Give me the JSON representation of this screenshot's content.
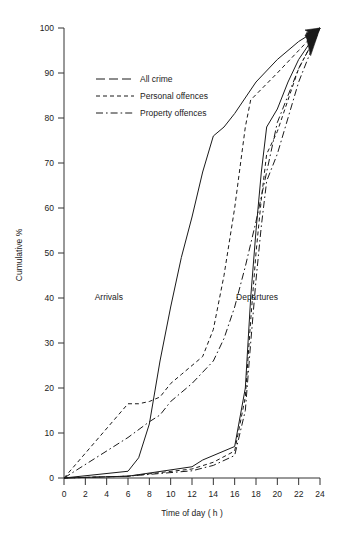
{
  "chart_data": {
    "type": "line",
    "title": "",
    "xlabel": "Time of day ( h )",
    "ylabel": "Cumulative %",
    "xlim": [
      0,
      24
    ],
    "ylim": [
      0,
      100
    ],
    "xticks": [
      0,
      2,
      4,
      6,
      8,
      10,
      12,
      14,
      16,
      18,
      20,
      22,
      24
    ],
    "yticks": [
      0,
      10,
      20,
      30,
      40,
      50,
      60,
      70,
      80,
      90,
      100
    ],
    "grid": false,
    "legend_position": "upper-left-inside",
    "annotations": [
      {
        "text": "Arrivals",
        "x": 4.2,
        "y": 39.5
      },
      {
        "text": "Departures",
        "x": 18.1,
        "y": 39.5
      }
    ],
    "legend": [
      {
        "name": "All crime",
        "dash": "long-dash"
      },
      {
        "name": "Personal offences",
        "dash": "short-dash"
      },
      {
        "name": "Property offences",
        "dash": "dash-dot"
      }
    ],
    "series": [
      {
        "name": "All crime",
        "group": "Arrivals",
        "dash": "solid",
        "points": [
          [
            0,
            0
          ],
          [
            6,
            1.5
          ],
          [
            7,
            4.5
          ],
          [
            8,
            12
          ],
          [
            9,
            26
          ],
          [
            10,
            38
          ],
          [
            11,
            49
          ],
          [
            12,
            58
          ],
          [
            13,
            68
          ],
          [
            14,
            76
          ],
          [
            15,
            78
          ],
          [
            16,
            81
          ],
          [
            18,
            88
          ],
          [
            20,
            93
          ],
          [
            22,
            97
          ],
          [
            24,
            100
          ]
        ]
      },
      {
        "name": "Personal offences",
        "group": "Arrivals",
        "dash": "short-dash",
        "points": [
          [
            0,
            0
          ],
          [
            6,
            16.5
          ],
          [
            7,
            16.5
          ],
          [
            8,
            17
          ],
          [
            9,
            18
          ],
          [
            10,
            21
          ],
          [
            11,
            23
          ],
          [
            12,
            25
          ],
          [
            13,
            27
          ],
          [
            14,
            33
          ],
          [
            15,
            45
          ],
          [
            16,
            60
          ],
          [
            17,
            78
          ],
          [
            17.5,
            84
          ],
          [
            20,
            90
          ],
          [
            22,
            95
          ],
          [
            24,
            100
          ]
        ]
      },
      {
        "name": "Property offences",
        "group": "Arrivals",
        "dash": "dash-dot",
        "points": [
          [
            0,
            0
          ],
          [
            6,
            9
          ],
          [
            8,
            12.5
          ],
          [
            9,
            14
          ],
          [
            10,
            17
          ],
          [
            11,
            19
          ],
          [
            12,
            21
          ],
          [
            14,
            26
          ],
          [
            15,
            31
          ],
          [
            16,
            38
          ],
          [
            17,
            47
          ],
          [
            18,
            57
          ],
          [
            19,
            68
          ],
          [
            20,
            79
          ],
          [
            22,
            91
          ],
          [
            24,
            100
          ]
        ]
      },
      {
        "name": "All crime",
        "group": "Departures",
        "dash": "solid",
        "points": [
          [
            0,
            0
          ],
          [
            6,
            0.4
          ],
          [
            12,
            2.5
          ],
          [
            13,
            4
          ],
          [
            16,
            7
          ],
          [
            17,
            20
          ],
          [
            17.5,
            40
          ],
          [
            18,
            55
          ],
          [
            18.5,
            68
          ],
          [
            19,
            78
          ],
          [
            20,
            82
          ],
          [
            21,
            88
          ],
          [
            22,
            93
          ],
          [
            24,
            100
          ]
        ]
      },
      {
        "name": "Personal offences",
        "group": "Departures",
        "dash": "short-dash",
        "points": [
          [
            0,
            0
          ],
          [
            6,
            0.4
          ],
          [
            12,
            2.0
          ],
          [
            14,
            3.5
          ],
          [
            16,
            6
          ],
          [
            17,
            18
          ],
          [
            17.5,
            35
          ],
          [
            18,
            50
          ],
          [
            18.5,
            62
          ],
          [
            19,
            72
          ],
          [
            20,
            77
          ],
          [
            21,
            84
          ],
          [
            22,
            91
          ],
          [
            24,
            100
          ]
        ]
      },
      {
        "name": "Property offences",
        "group": "Departures",
        "dash": "dash-dot",
        "points": [
          [
            0,
            0
          ],
          [
            6,
            0.4
          ],
          [
            12,
            1.6
          ],
          [
            14,
            2.8
          ],
          [
            16,
            5
          ],
          [
            17,
            15
          ],
          [
            17.5,
            30
          ],
          [
            18,
            44
          ],
          [
            18.5,
            56
          ],
          [
            19,
            66
          ],
          [
            20,
            72
          ],
          [
            21,
            80
          ],
          [
            22,
            88
          ],
          [
            24,
            100
          ]
        ]
      }
    ]
  }
}
